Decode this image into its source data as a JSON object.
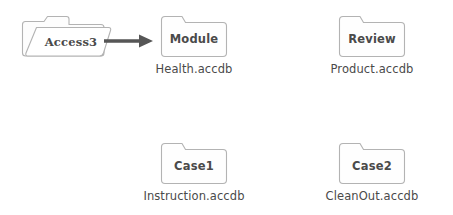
{
  "diagram": {
    "type": "folder-flow-diagram",
    "background_color": "#ffffff",
    "stroke_color": "#b3b3b3",
    "fill_color": "#fefefe",
    "text_color": "#4a4a4a",
    "arrow_color": "#555555",
    "source": {
      "name": "source-folder",
      "title": "Access3",
      "icon": "open-folder-icon",
      "caption": ""
    },
    "arrow": {
      "name": "flow-arrow",
      "direction": "right",
      "from": "Access3",
      "to": "Module"
    },
    "targets": [
      {
        "name": "module-folder",
        "title": "Module",
        "icon": "folder-icon",
        "caption": "Health.accdb",
        "row": 0,
        "column": 0
      },
      {
        "name": "review-folder",
        "title": "Review",
        "icon": "folder-icon",
        "caption": "Product.accdb",
        "row": 0,
        "column": 1
      },
      {
        "name": "case1-folder",
        "title": "Case1",
        "icon": "folder-icon",
        "caption": "Instruction.accdb",
        "row": 1,
        "column": 0
      },
      {
        "name": "case2-folder",
        "title": "Case2",
        "icon": "folder-icon",
        "caption": "CleanOut.accdb",
        "row": 1,
        "column": 1
      }
    ]
  }
}
